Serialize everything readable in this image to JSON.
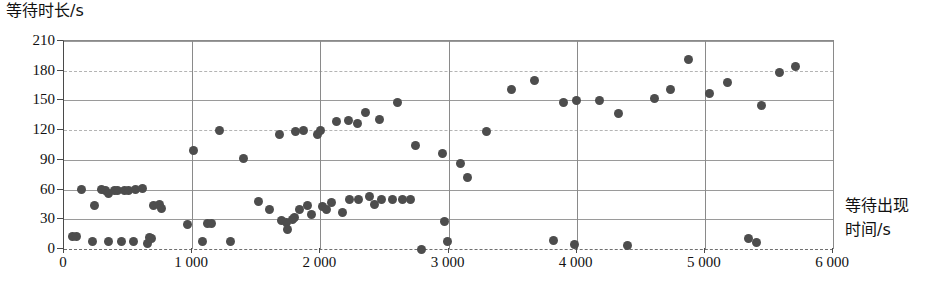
{
  "chart_data": {
    "type": "scatter",
    "title": "",
    "xlabel": "等待出现时间/s",
    "ylabel": "等待时长/s",
    "xlim": [
      0,
      6000
    ],
    "ylim": [
      0,
      210
    ],
    "xticks": [
      0,
      1000,
      2000,
      3000,
      4000,
      5000,
      6000
    ],
    "xtick_labels": [
      "0",
      "1 000",
      "2 000",
      "3 000",
      "4 000",
      "5 000",
      "6 000"
    ],
    "yticks": [
      0,
      30,
      60,
      90,
      120,
      150,
      180,
      210
    ],
    "ytick_labels": [
      "0",
      "30",
      "60",
      "90",
      "120",
      "150",
      "180",
      "210"
    ],
    "grid": true,
    "legend": null,
    "marker_color": "#4d4d4d",
    "points": [
      [
        70,
        13
      ],
      [
        95,
        13
      ],
      [
        140,
        60
      ],
      [
        225,
        8
      ],
      [
        235,
        44
      ],
      [
        290,
        60
      ],
      [
        320,
        59
      ],
      [
        345,
        56
      ],
      [
        350,
        8
      ],
      [
        395,
        59
      ],
      [
        420,
        59
      ],
      [
        450,
        8
      ],
      [
        470,
        59
      ],
      [
        500,
        59
      ],
      [
        545,
        8
      ],
      [
        560,
        60
      ],
      [
        610,
        61
      ],
      [
        650,
        6
      ],
      [
        665,
        12
      ],
      [
        680,
        11
      ],
      [
        700,
        44
      ],
      [
        745,
        45
      ],
      [
        760,
        41
      ],
      [
        960,
        25
      ],
      [
        1010,
        99
      ],
      [
        1080,
        8
      ],
      [
        1120,
        26
      ],
      [
        1150,
        26
      ],
      [
        1215,
        120
      ],
      [
        1300,
        8
      ],
      [
        1400,
        91
      ],
      [
        1520,
        48
      ],
      [
        1600,
        40
      ],
      [
        1680,
        116
      ],
      [
        1700,
        29
      ],
      [
        1735,
        27
      ],
      [
        1745,
        20
      ],
      [
        1780,
        30
      ],
      [
        1800,
        32
      ],
      [
        1810,
        119
      ],
      [
        1840,
        40
      ],
      [
        1870,
        120
      ],
      [
        1900,
        44
      ],
      [
        1930,
        35
      ],
      [
        1980,
        116
      ],
      [
        2000,
        120
      ],
      [
        2020,
        43
      ],
      [
        2050,
        40
      ],
      [
        2090,
        47
      ],
      [
        2130,
        129
      ],
      [
        2170,
        37
      ],
      [
        2220,
        130
      ],
      [
        2230,
        50
      ],
      [
        2290,
        127
      ],
      [
        2300,
        50
      ],
      [
        2350,
        138
      ],
      [
        2380,
        53
      ],
      [
        2420,
        45
      ],
      [
        2460,
        131
      ],
      [
        2480,
        50
      ],
      [
        2560,
        50
      ],
      [
        2600,
        148
      ],
      [
        2640,
        50
      ],
      [
        2700,
        50
      ],
      [
        2740,
        105
      ],
      [
        2790,
        0
      ],
      [
        2950,
        96
      ],
      [
        2970,
        28
      ],
      [
        2990,
        8
      ],
      [
        3090,
        86
      ],
      [
        3150,
        72
      ],
      [
        3300,
        119
      ],
      [
        3490,
        161
      ],
      [
        3670,
        170
      ],
      [
        3820,
        9
      ],
      [
        3900,
        148
      ],
      [
        3980,
        5
      ],
      [
        4000,
        150
      ],
      [
        4180,
        150
      ],
      [
        4330,
        137
      ],
      [
        4400,
        4
      ],
      [
        4610,
        152
      ],
      [
        4730,
        161
      ],
      [
        4870,
        191
      ],
      [
        5040,
        157
      ],
      [
        5180,
        168
      ],
      [
        5340,
        11
      ],
      [
        5400,
        7
      ],
      [
        5440,
        145
      ],
      [
        5580,
        178
      ],
      [
        5710,
        184
      ]
    ]
  }
}
